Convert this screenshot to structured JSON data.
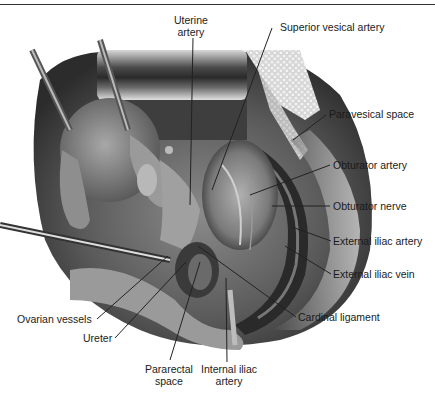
{
  "figure": {
    "type": "anatomical-illustration"
  },
  "labels": {
    "uterine_artery": "Uterine\nartery",
    "uterine_artery_l1": "Uterine",
    "uterine_artery_l2": "artery",
    "superior_vesical_artery": "Superior vesical artery",
    "paravesical_space": "Paravesical space",
    "obturator_artery": "Obturator artery",
    "obturator_nerve": "Obturator nerve",
    "external_iliac_artery": "External iliac artery",
    "external_iliac_vein": "External iliac vein",
    "cardinal_ligament": "Cardinal ligament",
    "ovarian_vessels": "Ovarian vessels",
    "ureter": "Ureter",
    "pararectal_space_l1": "Pararectal",
    "pararectal_space_l2": "space",
    "internal_iliac_artery_l1": "Internal iliac",
    "internal_iliac_artery_l2": "artery"
  },
  "colors": {
    "leader_line": "#222222",
    "label_text": "#1a1a1a"
  }
}
